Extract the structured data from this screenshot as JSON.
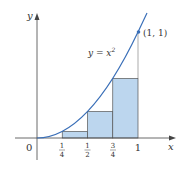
{
  "title": "",
  "axes": {
    "x_label": "x",
    "y_label": "y",
    "origin_label": "0"
  },
  "curve": {
    "label": "y = x",
    "exponent": "2",
    "color": "#3a6fb8"
  },
  "point": {
    "label": "(1, 1)"
  },
  "ticks": [
    {
      "num": "1",
      "den": "4"
    },
    {
      "num": "1",
      "den": "2"
    },
    {
      "num": "3",
      "den": "4"
    },
    {
      "num": "1",
      "den": ""
    }
  ],
  "rect_fill": "#bcd6ee",
  "rectangles": [
    {
      "x0": 0.25,
      "x1": 0.5,
      "height": 0.0625
    },
    {
      "x0": 0.5,
      "x1": 0.75,
      "height": 0.25
    },
    {
      "x0": 0.75,
      "x1": 1.0,
      "height": 0.5625
    }
  ]
}
